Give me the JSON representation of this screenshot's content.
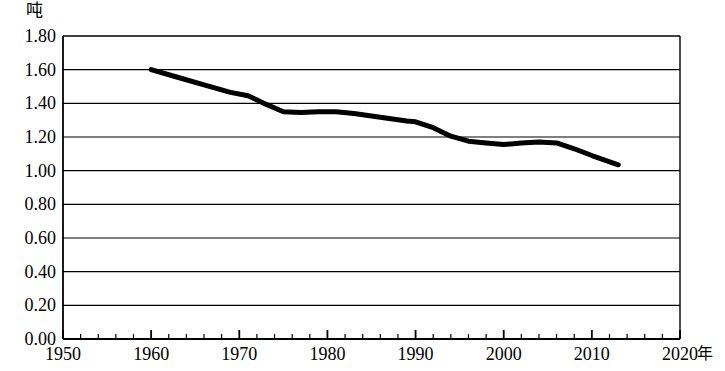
{
  "chart_data": {
    "type": "line",
    "title": "",
    "xlabel": "年",
    "ylabel": "吨",
    "xlim": [
      1950,
      2020
    ],
    "ylim": [
      0.0,
      1.8
    ],
    "grid": true,
    "legend": false,
    "x_ticks": [
      "1950",
      "1960",
      "1970",
      "1980",
      "1990",
      "2000",
      "2010",
      "2020"
    ],
    "x_tick_values": [
      1950,
      1960,
      1970,
      1980,
      1990,
      2000,
      2010,
      2020
    ],
    "x_minor_tick_step": 2,
    "y_ticks": [
      "0.00",
      "0.20",
      "0.40",
      "0.60",
      "0.80",
      "1.00",
      "1.20",
      "1.40",
      "1.60",
      "1.80"
    ],
    "y_tick_values": [
      0.0,
      0.2,
      0.4,
      0.6,
      0.8,
      1.0,
      1.2,
      1.4,
      1.6,
      1.8
    ],
    "series": [
      {
        "name": "",
        "color": "#000000",
        "line_width": 5,
        "x": [
          1960,
          1963,
          1966,
          1969,
          1971,
          1973,
          1975,
          1977,
          1979,
          1981,
          1983,
          1985,
          1987,
          1989,
          1990,
          1992,
          1994,
          1996,
          1998,
          2000,
          2002,
          2004,
          2006,
          2008,
          2010,
          2013
        ],
        "values": [
          1.6,
          1.555,
          1.51,
          1.465,
          1.445,
          1.395,
          1.35,
          1.345,
          1.35,
          1.35,
          1.34,
          1.325,
          1.31,
          1.295,
          1.29,
          1.255,
          1.205,
          1.175,
          1.165,
          1.155,
          1.165,
          1.17,
          1.165,
          1.13,
          1.09,
          1.035
        ]
      }
    ]
  },
  "axes": {
    "unit_y": "吨",
    "unit_x": "年"
  }
}
